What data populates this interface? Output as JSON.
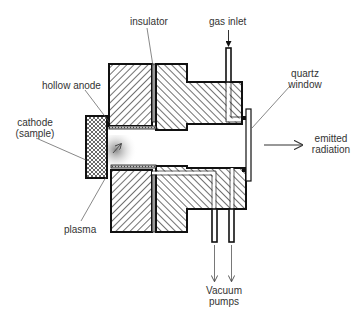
{
  "diagram": {
    "colors": {
      "outline": "#111111",
      "hatch": "#333333",
      "insulator": "#999999",
      "label_text": "#333333",
      "leader": "#555555"
    },
    "labels": {
      "insulator": "insulator",
      "gas_inlet": "gas inlet",
      "hollow_anode": "hollow anode",
      "quartz_window_line1": "quartz",
      "quartz_window_line2": "window",
      "cathode_line1": "cathode",
      "cathode_line2": "(sample)",
      "emitted_radiation_line1": "emitted",
      "emitted_radiation_line2": "radiation",
      "plasma": "plasma",
      "vacuum_pumps_line1": "Vacuum",
      "vacuum_pumps_line2": "pumps"
    },
    "components": [
      "insulator",
      "gas inlet",
      "hollow anode",
      "quartz window",
      "cathode (sample)",
      "emitted radiation",
      "plasma",
      "vacuum pumps"
    ]
  }
}
